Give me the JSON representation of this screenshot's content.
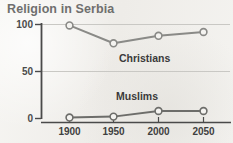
{
  "chart_data": {
    "type": "line",
    "title": "Religion in Serbia",
    "xlabel": "",
    "ylabel": "",
    "x": [
      1900,
      1950,
      2000,
      2050
    ],
    "xtick_labels": [
      "1900",
      "1950",
      "2000",
      "2050"
    ],
    "ytick_labels": [
      "0",
      "50",
      "100"
    ],
    "yticks": [
      0,
      50,
      100
    ],
    "ylim": [
      0,
      108
    ],
    "xlim": [
      1880,
      2070
    ],
    "grid": "horizontal",
    "legend_position": "inline-annotation",
    "series": [
      {
        "name": "Christians",
        "label": "Christians",
        "values": [
          99,
          80,
          88,
          92
        ],
        "color": "#8a8a87",
        "marker": "open-circle"
      },
      {
        "name": "Muslims",
        "label": "Muslims",
        "values": [
          1,
          2,
          8,
          8
        ],
        "color": "#6d6d6a",
        "marker": "open-circle"
      }
    ],
    "annotations": [
      {
        "text": "Christians",
        "x": 1955,
        "y": 62
      },
      {
        "text": "Muslims",
        "x": 1952,
        "y": 28
      }
    ]
  },
  "colors": {
    "background": "#f2f1ee",
    "title": "#6f6f6e",
    "axis": "#4a4a4a",
    "gridline": "#c9c8c4",
    "christians_line": "#8a8a87",
    "muslims_line": "#6d6d6a",
    "marker_fill": "#f4f3f0"
  }
}
